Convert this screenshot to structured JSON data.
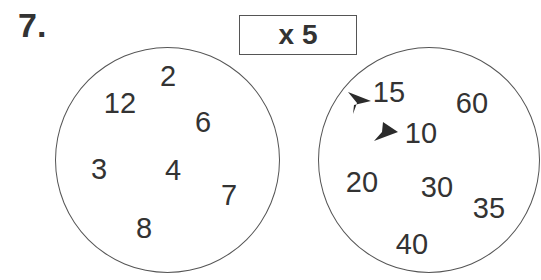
{
  "question_number": "7.",
  "operation": "x 5",
  "input_circle": {
    "numbers": [
      {
        "value": "2",
        "x": 168,
        "y": 76
      },
      {
        "value": "12",
        "x": 120,
        "y": 103
      },
      {
        "value": "6",
        "x": 203,
        "y": 122
      },
      {
        "value": "3",
        "x": 99,
        "y": 169
      },
      {
        "value": "4",
        "x": 173,
        "y": 170
      },
      {
        "value": "7",
        "x": 229,
        "y": 195
      },
      {
        "value": "8",
        "x": 144,
        "y": 228
      }
    ]
  },
  "output_circle": {
    "numbers": [
      {
        "value": "15",
        "x": 389,
        "y": 92
      },
      {
        "value": "60",
        "x": 472,
        "y": 103
      },
      {
        "value": "10",
        "x": 421,
        "y": 133
      },
      {
        "value": "20",
        "x": 362,
        "y": 182
      },
      {
        "value": "30",
        "x": 437,
        "y": 187
      },
      {
        "value": "35",
        "x": 489,
        "y": 208
      },
      {
        "value": "40",
        "x": 412,
        "y": 244
      }
    ],
    "arrows": [
      {
        "target": "15",
        "x": 360,
        "y": 103
      },
      {
        "target": "10",
        "x": 387,
        "y": 132
      }
    ]
  }
}
